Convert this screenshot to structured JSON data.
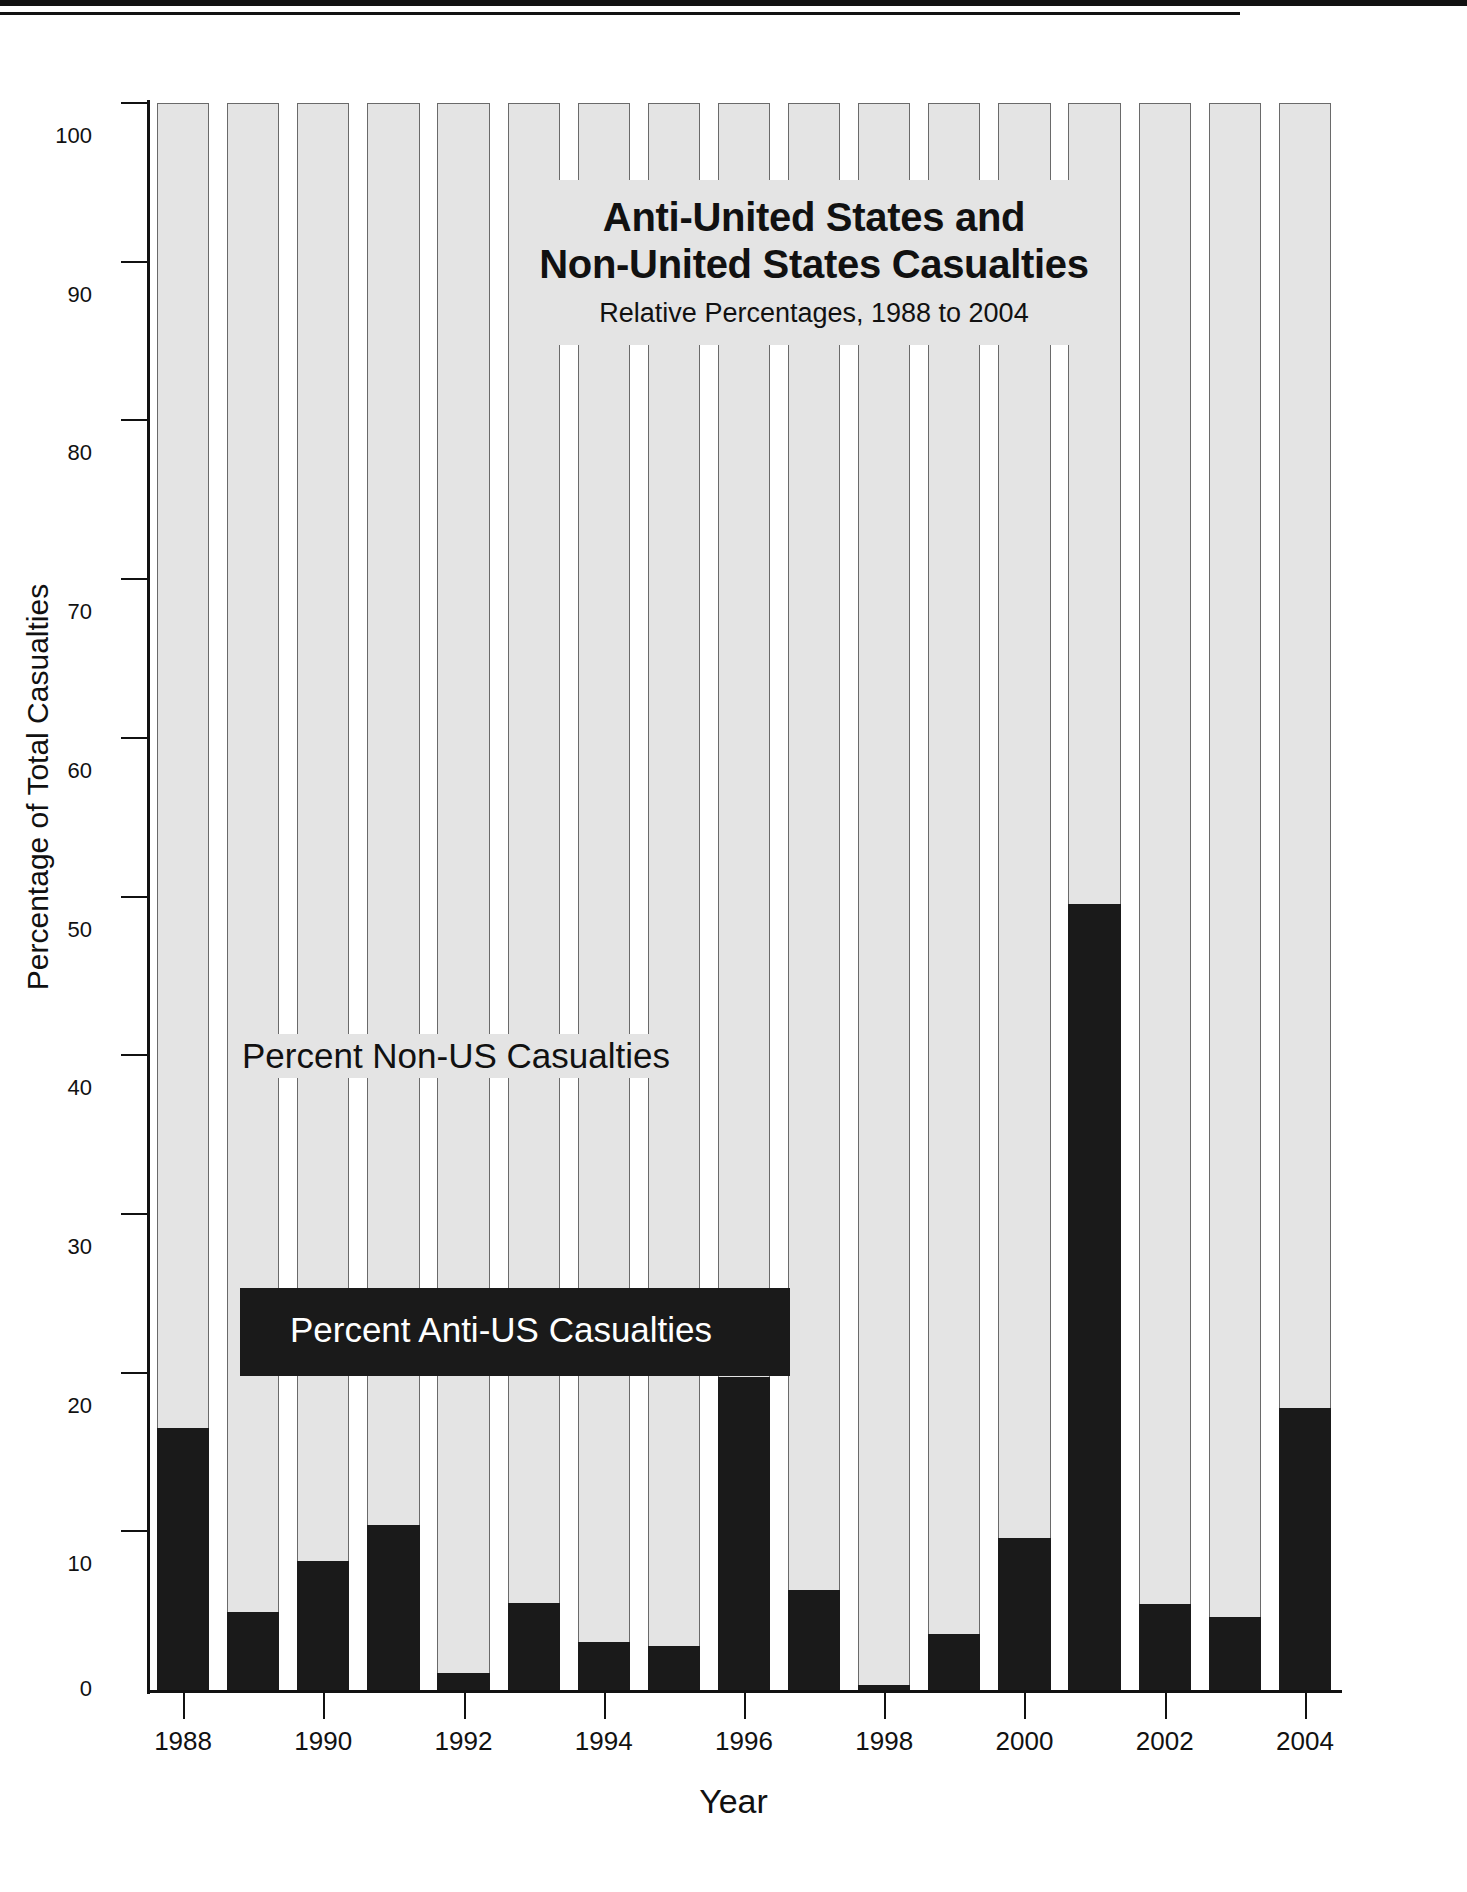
{
  "title": {
    "line1": "Anti-United States and",
    "line2": "Non-United States Casualties",
    "subtitle": "Relative Percentages, 1988 to 2004"
  },
  "labels": {
    "non_us_series": "Percent Non-US Casualties",
    "anti_us_series": "Percent Anti-US Casualties"
  },
  "colors": {
    "non_us_fill": "#e4e4e4",
    "anti_us_fill": "#1a1a1a",
    "bar_outline": "#6a6a6a",
    "axis": "#111111",
    "background": "#ffffff"
  },
  "chart_data": {
    "type": "bar",
    "title": "Anti-United States and Non-United States Casualties",
    "subtitle": "Relative Percentages, 1988 to 2004",
    "xlabel": "Year",
    "ylabel": "Percentage of Total Casualties",
    "ylim": [
      0,
      100
    ],
    "yticks": [
      0,
      10,
      20,
      30,
      40,
      50,
      60,
      70,
      80,
      90,
      100
    ],
    "ytick_labels": [
      "0",
      "10",
      "20",
      "30",
      "40",
      "50",
      "60",
      "70",
      "80",
      "90",
      "100"
    ],
    "xticks": [
      1988,
      1990,
      1992,
      1994,
      1996,
      1998,
      2000,
      2002,
      2004
    ],
    "xtick_labels": [
      "1988",
      "1990",
      "1992",
      "1994",
      "1996",
      "1998",
      "2000",
      "2002",
      "2004"
    ],
    "categories": [
      1988,
      1989,
      1990,
      1991,
      1992,
      1993,
      1994,
      1995,
      1996,
      1997,
      1998,
      1999,
      2000,
      2001,
      2002,
      2003,
      2004
    ],
    "stacked": true,
    "grid": false,
    "legend_position": "inside-plot",
    "series": [
      {
        "name": "Percent Anti-US Casualties",
        "color": "#1a1a1a",
        "values": [
          16.5,
          4.9,
          8.1,
          10.4,
          1.1,
          5.5,
          3.0,
          2.8,
          19.7,
          6.3,
          0.3,
          3.5,
          9.6,
          49.5,
          5.4,
          4.6,
          17.8
        ]
      },
      {
        "name": "Percent Non-US Casualties",
        "color": "#e4e4e4",
        "values": [
          83.5,
          95.1,
          91.9,
          89.6,
          98.9,
          94.5,
          97.0,
          97.2,
          80.3,
          93.7,
          99.7,
          96.5,
          90.4,
          50.5,
          94.6,
          95.4,
          82.2
        ]
      }
    ]
  }
}
